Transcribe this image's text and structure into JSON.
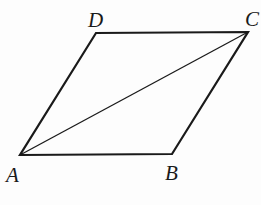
{
  "diagram": {
    "type": "parallelogram-with-diagonal",
    "vertices": [
      {
        "name": "A",
        "x": 20,
        "y": 155,
        "label_x": 6,
        "label_y": 182
      },
      {
        "name": "B",
        "x": 172,
        "y": 154,
        "label_x": 165,
        "label_y": 180
      },
      {
        "name": "C",
        "x": 248,
        "y": 32,
        "label_x": 245,
        "label_y": 26
      },
      {
        "name": "D",
        "x": 96,
        "y": 33,
        "label_x": 88,
        "label_y": 27
      }
    ],
    "labels": {
      "A": "A",
      "B": "B",
      "C": "C",
      "D": "D"
    },
    "edges": [
      [
        "A",
        "B"
      ],
      [
        "B",
        "C"
      ],
      [
        "C",
        "D"
      ],
      [
        "D",
        "A"
      ]
    ],
    "diagonals": [
      [
        "A",
        "C"
      ]
    ],
    "stroke_color": "#1a1a1a"
  }
}
